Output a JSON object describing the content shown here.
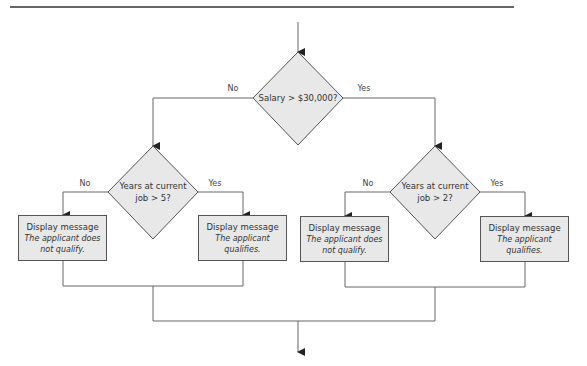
{
  "diagram": {
    "type": "flowchart",
    "start_decision": {
      "label": "Salary > $30,000?",
      "no_label": "No",
      "yes_label": "Yes"
    },
    "left_decision": {
      "label_line1": "Years at current",
      "label_line2": "job > 5?",
      "no_label": "No",
      "yes_label": "Yes"
    },
    "right_decision": {
      "label_line1": "Years at current",
      "label_line2": "job > 2?",
      "no_label": "No",
      "yes_label": "Yes"
    },
    "boxes": [
      {
        "title": "Display message",
        "message": "The applicant does not qualify."
      },
      {
        "title": "Display message",
        "message": "The applicant qualifies."
      },
      {
        "title": "Display message",
        "message": "The applicant does not qualify."
      },
      {
        "title": "Display message",
        "message": "The applicant qualifies."
      }
    ],
    "colors": {
      "shape_fill": "#e8e8e8",
      "stroke": "#555555",
      "text": "#333333"
    }
  }
}
